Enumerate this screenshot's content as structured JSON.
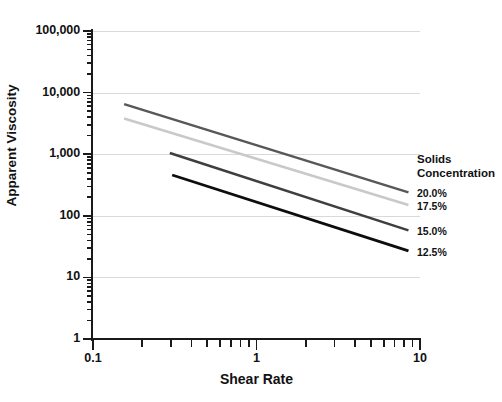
{
  "chart_data": {
    "type": "line",
    "title": "",
    "xlabel": "Shear Rate",
    "ylabel": "Apparent Viscosity",
    "xscale": "log",
    "yscale": "log",
    "xlim": [
      0.1,
      10
    ],
    "ylim": [
      1,
      100000
    ],
    "grid": true,
    "x_ticks": [
      {
        "value": 0.1,
        "label": "0.1"
      },
      {
        "value": 1,
        "label": "1"
      },
      {
        "value": 10,
        "label": "10"
      }
    ],
    "y_ticks": [
      {
        "value": 100000,
        "label": "100,000"
      },
      {
        "value": 10000,
        "label": "10,000"
      },
      {
        "value": 1000,
        "label": "1,000"
      },
      {
        "value": 100,
        "label": "100"
      },
      {
        "value": 10,
        "label": "10"
      },
      {
        "value": 1,
        "label": "1"
      }
    ],
    "legend_position": "right",
    "legend_title_lines": [
      "Solids",
      "Concentration"
    ],
    "series": [
      {
        "name": "20.0%",
        "color": "#585858",
        "width": 2.6,
        "x": [
          0.155,
          8.5
        ],
        "y": [
          6500,
          240
        ]
      },
      {
        "name": "17.5%",
        "color": "#c9c9c9",
        "width": 2.6,
        "x": [
          0.155,
          8.5
        ],
        "y": [
          3800,
          150
        ]
      },
      {
        "name": "15.0%",
        "color": "#3f3f3f",
        "width": 2.6,
        "x": [
          0.295,
          8.5
        ],
        "y": [
          1050,
          58
        ]
      },
      {
        "name": "12.5%",
        "color": "#0d0d0d",
        "width": 2.8,
        "x": [
          0.305,
          8.5
        ],
        "y": [
          460,
          27
        ]
      }
    ]
  },
  "axis": {
    "y_title": "Apparent Viscosity",
    "x_title": "Shear Rate"
  },
  "legend": {
    "title_line_1": "Solids",
    "title_line_2": "Concentration",
    "items": [
      {
        "label": "20.0%"
      },
      {
        "label": "17.5%"
      },
      {
        "label": "15.0%"
      },
      {
        "label": "12.5%"
      }
    ]
  }
}
